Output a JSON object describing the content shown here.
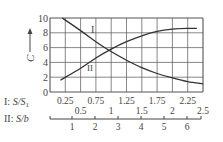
{
  "chart_data": {
    "type": "line",
    "title": "",
    "ylabel": "C",
    "xlabel_primary": "I: S/S1",
    "xlabel_secondary": "II: S/b",
    "ylim": [
      0,
      10
    ],
    "xlim_primary": [
      0,
      2.5
    ],
    "xlim_secondary": [
      0,
      6.6
    ],
    "grid": true,
    "y_ticks": [
      "0",
      "2",
      "4",
      "6",
      "8",
      "10"
    ],
    "x_ticks_primary_row1": [
      "0.25",
      "0.75",
      "1.25",
      "1.75",
      "2.25"
    ],
    "x_ticks_primary_row2": [
      "0.5",
      "1",
      "1.5",
      "2",
      "2.5"
    ],
    "x_ticks_secondary": [
      "1",
      "2",
      "3",
      "4",
      "5",
      "6"
    ],
    "series": [
      {
        "name": "I",
        "label": "I",
        "description": "C vs S/S1 (decreasing)",
        "x": [
          0.2,
          0.5,
          0.75,
          0.95,
          1.25,
          1.5,
          1.75,
          2.0,
          2.25,
          2.5
        ],
        "y": [
          10,
          8.3,
          6.8,
          5.7,
          4.3,
          3.3,
          2.5,
          1.9,
          1.4,
          1.1
        ]
      },
      {
        "name": "II",
        "label": "II",
        "description": "C vs S/b (increasing)",
        "x": [
          0.17,
          0.5,
          0.75,
          1.0,
          1.25,
          1.5,
          1.75,
          2.0,
          2.25,
          2.4
        ],
        "y": [
          1.6,
          3.2,
          4.6,
          5.8,
          6.8,
          7.6,
          8.2,
          8.5,
          8.6,
          8.6
        ]
      }
    ]
  },
  "labels": {
    "y_axis": "C",
    "axis_I_prefix": "I",
    "axis_I_name": "S/S",
    "axis_I_sub": "1",
    "axis_II_prefix": "II",
    "axis_II_name": "S/b",
    "curve_I": "I",
    "curve_II": "II"
  }
}
